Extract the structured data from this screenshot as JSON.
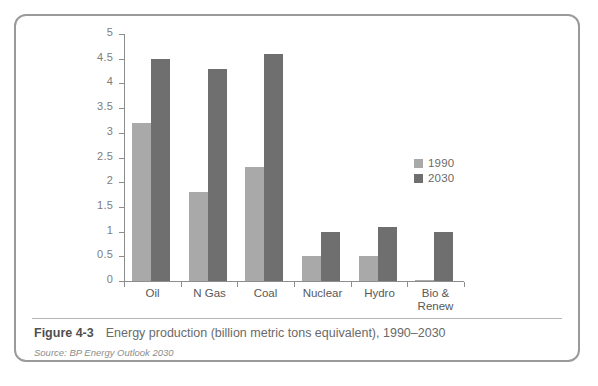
{
  "figure": {
    "number": "Figure 4-3",
    "title": "Energy production (billion metric tons equivalent), 1990–2030",
    "source": "Source: BP Energy Outlook 2030"
  },
  "colors": {
    "series_1990": "#a9a9a9",
    "series_2030": "#6f6f6f",
    "axis": "#8d8d8d",
    "frame": "#9a9a9a",
    "text": "#6a6a6a"
  },
  "chart_data": {
    "type": "bar",
    "title": "Energy production (billion metric tons equivalent), 1990–2030",
    "xlabel": "",
    "ylabel": "",
    "ylim": [
      0,
      5
    ],
    "ytick_labels": [
      "0",
      "0.5",
      "1",
      "1.5",
      "2",
      "2.5",
      "3",
      "3.5",
      "4",
      "4.5",
      "5"
    ],
    "yticks": [
      0,
      0.5,
      1,
      1.5,
      2,
      2.5,
      3,
      3.5,
      4,
      4.5,
      5
    ],
    "grid": false,
    "legend_position": "right-center",
    "categories": [
      "Oil",
      "N Gas",
      "Coal",
      "Nuclear",
      "Hydro",
      "Bio &\nRenew"
    ],
    "series": [
      {
        "name": "1990",
        "color": "#a9a9a9",
        "values": [
          3.2,
          1.8,
          2.3,
          0.5,
          0.5,
          0.02
        ]
      },
      {
        "name": "2030",
        "color": "#6f6f6f",
        "values": [
          4.5,
          4.3,
          4.6,
          1.0,
          1.1,
          1.0
        ]
      }
    ]
  }
}
